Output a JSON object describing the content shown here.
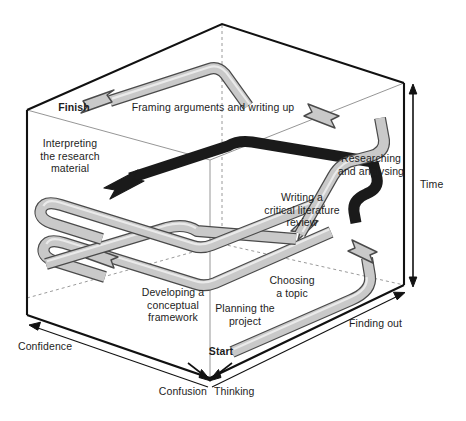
{
  "figure": {
    "type": "3d-process-diagram"
  },
  "axes": [
    {
      "id": "time",
      "label": "Time",
      "direction": "vertical-down-right"
    },
    {
      "id": "finding_out",
      "label": "Finding out",
      "direction": "right-depth"
    },
    {
      "id": "thinking",
      "label": "Thinking",
      "direction": "down-right"
    },
    {
      "id": "confusion",
      "label": "Confusion",
      "direction": "down-left"
    },
    {
      "id": "confidence",
      "label": "Confidence",
      "direction": "left-depth"
    }
  ],
  "markers": {
    "start": "Start",
    "finish": "Finish"
  },
  "stages": [
    {
      "id": "planning",
      "label": "Planning the\nproject"
    },
    {
      "id": "choosing",
      "label": "Choosing\na topic"
    },
    {
      "id": "developing",
      "label": "Developing a\nconceptual\nframework"
    },
    {
      "id": "lit_review",
      "label": "Writing a\ncritical literature\nreview"
    },
    {
      "id": "researching",
      "label": "Researching\nand analysing"
    },
    {
      "id": "interpreting",
      "label": "Interpreting\nthe research\nmaterial"
    },
    {
      "id": "framing",
      "label": "Framing arguments and writing up"
    }
  ],
  "colors": {
    "ribbon_fill": "#c9c9c9",
    "ribbon_stroke": "#4a4a4a",
    "ribbon_highlight": "#e8e8e8",
    "dark_ribbon": "#1a1a1a",
    "cube_edge": "#111111",
    "cube_thin_edge": "#8a8a8a",
    "hidden_edge": "#9a9a9a",
    "text": "#1d1d1d",
    "background": "#ffffff"
  }
}
